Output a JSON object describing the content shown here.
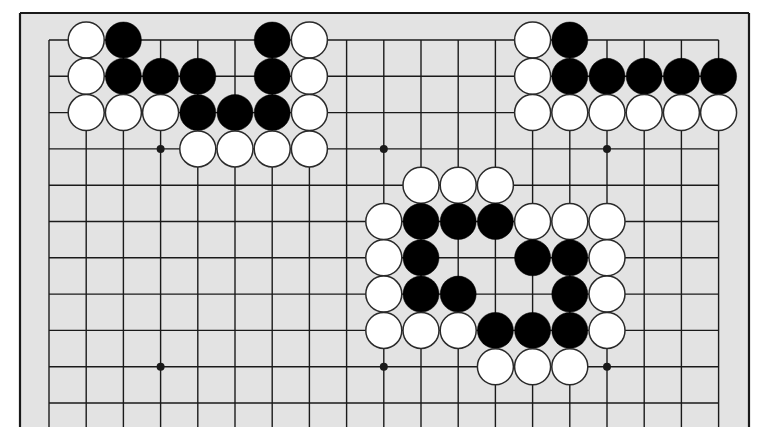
{
  "board": {
    "size_columns": 19,
    "visible_rows": 11,
    "frame": {
      "left": 20,
      "top": 13,
      "right": 749,
      "bottom": 427
    },
    "grid_origin": {
      "x": 49,
      "y": 40
    },
    "spacing": {
      "x": 37.2,
      "y": 36.3
    },
    "stone_radius": 18,
    "colors": {
      "board_bg": "#e3e3e3",
      "line": "#1a1a1a",
      "frame": "#1a1a1a",
      "black_stone": "#000000",
      "white_stone": "#ffffff",
      "white_outline": "#2a2a2a"
    },
    "star_points": [
      {
        "col": 3,
        "row": 3
      },
      {
        "col": 9,
        "row": 3
      },
      {
        "col": 15,
        "row": 3
      },
      {
        "col": 3,
        "row": 9
      },
      {
        "col": 9,
        "row": 9
      },
      {
        "col": 15,
        "row": 9
      }
    ],
    "stones": [
      {
        "color": "white",
        "col": 1,
        "row": 0
      },
      {
        "color": "black",
        "col": 2,
        "row": 0
      },
      {
        "color": "black",
        "col": 6,
        "row": 0
      },
      {
        "color": "white",
        "col": 7,
        "row": 0
      },
      {
        "color": "white",
        "col": 1,
        "row": 1
      },
      {
        "color": "black",
        "col": 2,
        "row": 1
      },
      {
        "color": "black",
        "col": 3,
        "row": 1
      },
      {
        "color": "black",
        "col": 4,
        "row": 1
      },
      {
        "color": "black",
        "col": 6,
        "row": 1
      },
      {
        "color": "white",
        "col": 7,
        "row": 1
      },
      {
        "color": "white",
        "col": 1,
        "row": 2
      },
      {
        "color": "white",
        "col": 2,
        "row": 2
      },
      {
        "color": "white",
        "col": 3,
        "row": 2
      },
      {
        "color": "black",
        "col": 4,
        "row": 2
      },
      {
        "color": "black",
        "col": 5,
        "row": 2
      },
      {
        "color": "black",
        "col": 6,
        "row": 2
      },
      {
        "color": "white",
        "col": 7,
        "row": 2
      },
      {
        "color": "white",
        "col": 4,
        "row": 3
      },
      {
        "color": "white",
        "col": 5,
        "row": 3
      },
      {
        "color": "white",
        "col": 6,
        "row": 3
      },
      {
        "color": "white",
        "col": 7,
        "row": 3
      },
      {
        "color": "white",
        "col": 13,
        "row": 0
      },
      {
        "color": "black",
        "col": 14,
        "row": 0
      },
      {
        "color": "white",
        "col": 13,
        "row": 1
      },
      {
        "color": "black",
        "col": 14,
        "row": 1
      },
      {
        "color": "black",
        "col": 15,
        "row": 1
      },
      {
        "color": "black",
        "col": 16,
        "row": 1
      },
      {
        "color": "black",
        "col": 17,
        "row": 1
      },
      {
        "color": "black",
        "col": 18,
        "row": 1
      },
      {
        "color": "white",
        "col": 13,
        "row": 2
      },
      {
        "color": "white",
        "col": 14,
        "row": 2
      },
      {
        "color": "white",
        "col": 15,
        "row": 2
      },
      {
        "color": "white",
        "col": 16,
        "row": 2
      },
      {
        "color": "white",
        "col": 17,
        "row": 2
      },
      {
        "color": "white",
        "col": 18,
        "row": 2
      },
      {
        "color": "white",
        "col": 10,
        "row": 4
      },
      {
        "color": "white",
        "col": 11,
        "row": 4
      },
      {
        "color": "white",
        "col": 12,
        "row": 4
      },
      {
        "color": "white",
        "col": 9,
        "row": 5
      },
      {
        "color": "black",
        "col": 10,
        "row": 5
      },
      {
        "color": "black",
        "col": 11,
        "row": 5
      },
      {
        "color": "black",
        "col": 12,
        "row": 5
      },
      {
        "color": "white",
        "col": 13,
        "row": 5
      },
      {
        "color": "white",
        "col": 14,
        "row": 5
      },
      {
        "color": "white",
        "col": 15,
        "row": 5
      },
      {
        "color": "white",
        "col": 9,
        "row": 6
      },
      {
        "color": "black",
        "col": 10,
        "row": 6
      },
      {
        "color": "black",
        "col": 13,
        "row": 6
      },
      {
        "color": "black",
        "col": 14,
        "row": 6
      },
      {
        "color": "white",
        "col": 15,
        "row": 6
      },
      {
        "color": "white",
        "col": 9,
        "row": 7
      },
      {
        "color": "black",
        "col": 10,
        "row": 7
      },
      {
        "color": "black",
        "col": 11,
        "row": 7
      },
      {
        "color": "black",
        "col": 14,
        "row": 7
      },
      {
        "color": "white",
        "col": 15,
        "row": 7
      },
      {
        "color": "white",
        "col": 9,
        "row": 8
      },
      {
        "color": "white",
        "col": 10,
        "row": 8
      },
      {
        "color": "white",
        "col": 11,
        "row": 8
      },
      {
        "color": "black",
        "col": 12,
        "row": 8
      },
      {
        "color": "black",
        "col": 13,
        "row": 8
      },
      {
        "color": "black",
        "col": 14,
        "row": 8
      },
      {
        "color": "white",
        "col": 15,
        "row": 8
      },
      {
        "color": "white",
        "col": 12,
        "row": 9
      },
      {
        "color": "white",
        "col": 13,
        "row": 9
      },
      {
        "color": "white",
        "col": 14,
        "row": 9
      }
    ]
  }
}
